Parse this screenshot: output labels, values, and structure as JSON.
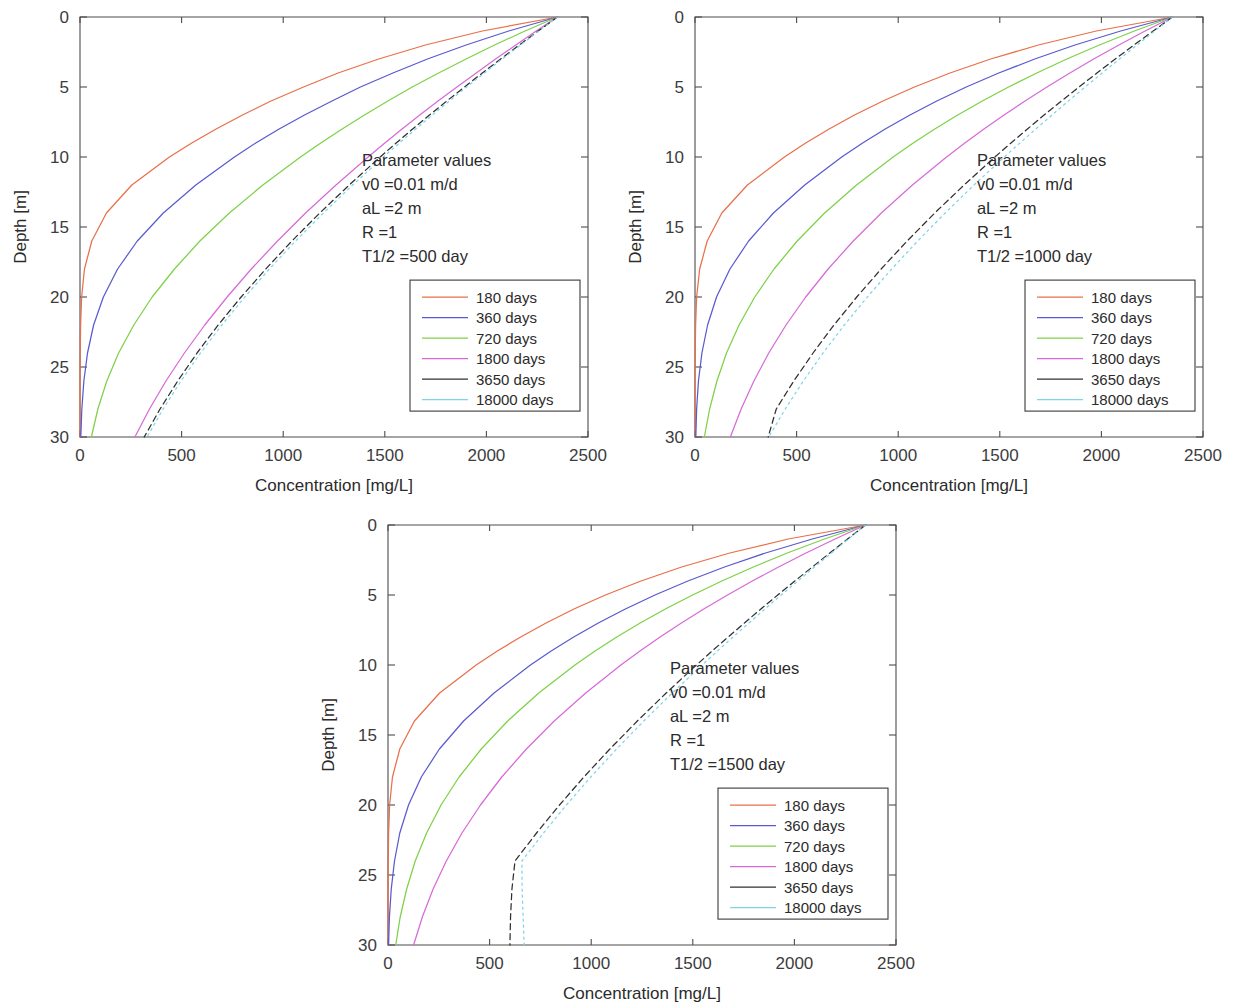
{
  "figure": {
    "panel_count": 3,
    "common": {
      "xlabel": "Concentration [mg/L]",
      "ylabel": "Depth [m]",
      "xticks": [
        "0",
        "500",
        "1000",
        "1500",
        "2000",
        "2500"
      ],
      "yticks": [
        "0",
        "5",
        "10",
        "15",
        "20",
        "25",
        "30"
      ],
      "param_header": "Parameter values",
      "param_v0": "v0 =0.01 m/d",
      "param_aL": "aL =2 m",
      "param_R": "R =1"
    },
    "colors": {
      "c180": "#e8704a",
      "c360": "#5a5ad0",
      "c720": "#7ed148",
      "c1800": "#d86ad8",
      "c3650": "#303030",
      "c18000": "#7fd4e8",
      "axis": "#4d4d4d",
      "text": "#2b2b2b"
    },
    "legend": {
      "entries": [
        {
          "label": "180 days",
          "color_key": "c180"
        },
        {
          "label": "360 days",
          "color_key": "c360"
        },
        {
          "label": "720 days",
          "color_key": "c720"
        },
        {
          "label": "1800 days",
          "color_key": "c1800"
        },
        {
          "label": "3650 days",
          "color_key": "c3650"
        },
        {
          "label": "18000 days",
          "color_key": "c18000"
        }
      ]
    }
  },
  "chart_data": [
    {
      "type": "line",
      "panel_id": "panel-1",
      "title": "",
      "xlabel": "Concentration [mg/L]",
      "ylabel": "Depth [m]",
      "xlim": [
        0,
        2500
      ],
      "ylim": [
        30,
        0
      ],
      "y_inverted": true,
      "grid": false,
      "legend_position": "inside-right-lower",
      "annotation": {
        "header": "Parameter values",
        "lines": [
          "v0 =0.01 m/d",
          "aL =2 m",
          "R =1",
          "T1/2 =500 day"
        ],
        "half_life_days": 500
      },
      "x_tick_values": [
        0,
        500,
        1000,
        1500,
        2000,
        2500
      ],
      "y_tick_values": [
        0,
        5,
        10,
        15,
        20,
        25,
        30
      ],
      "source_concentration": 2350,
      "depths": [
        0,
        1,
        2,
        3,
        4,
        5,
        6,
        7,
        8,
        9,
        10,
        12,
        14,
        16,
        18,
        20,
        22,
        24,
        26,
        28,
        30
      ],
      "series": [
        {
          "name": "180 days",
          "color": "#e8704a",
          "values": [
            2350,
            1980,
            1700,
            1470,
            1270,
            1100,
            940,
            800,
            670,
            550,
            440,
            255,
            130,
            58,
            22,
            8,
            3,
            1,
            0,
            0,
            0
          ]
        },
        {
          "name": "360 days",
          "color": "#5a5ad0",
          "values": [
            2350,
            2110,
            1900,
            1710,
            1540,
            1380,
            1240,
            1105,
            980,
            865,
            760,
            570,
            410,
            282,
            185,
            115,
            67,
            37,
            19,
            9,
            4
          ]
        },
        {
          "name": "720 days",
          "color": "#7ed148",
          "values": [
            2350,
            2190,
            2040,
            1900,
            1765,
            1635,
            1515,
            1400,
            1290,
            1185,
            1085,
            900,
            735,
            590,
            465,
            355,
            265,
            190,
            132,
            88,
            56
          ]
        },
        {
          "name": "1800 days",
          "color": "#d86ad8",
          "values": [
            2350,
            2245,
            2145,
            2045,
            1950,
            1855,
            1762,
            1672,
            1585,
            1500,
            1418,
            1260,
            1110,
            972,
            843,
            724,
            614,
            514,
            423,
            342,
            270
          ]
        },
        {
          "name": "3650 days",
          "color": "#303030",
          "values": [
            2350,
            2255,
            2162,
            2070,
            1980,
            1892,
            1805,
            1720,
            1637,
            1556,
            1477,
            1325,
            1180,
            1043,
            914,
            793,
            680,
            576,
            481,
            394,
            316
          ]
        },
        {
          "name": "18000 days",
          "color": "#7fd4e8",
          "values": [
            2350,
            2258,
            2168,
            2078,
            1990,
            1903,
            1818,
            1734,
            1652,
            1572,
            1493,
            1342,
            1198,
            1061,
            932,
            811,
            698,
            593,
            497,
            409,
            330
          ]
        }
      ]
    },
    {
      "type": "line",
      "panel_id": "panel-2",
      "title": "",
      "xlabel": "Concentration [mg/L]",
      "ylabel": "Depth [m]",
      "xlim": [
        0,
        2500
      ],
      "ylim": [
        30,
        0
      ],
      "y_inverted": true,
      "grid": false,
      "legend_position": "inside-right-lower",
      "annotation": {
        "header": "Parameter values",
        "lines": [
          "v0 =0.01 m/d",
          "aL =2 m",
          "R =1",
          "T1/2 =1000 day"
        ],
        "half_life_days": 1000
      },
      "x_tick_values": [
        0,
        500,
        1000,
        1500,
        2000,
        2500
      ],
      "y_tick_values": [
        0,
        5,
        10,
        15,
        20,
        25,
        30
      ],
      "source_concentration": 2350,
      "depths": [
        0,
        1,
        2,
        3,
        4,
        5,
        6,
        7,
        8,
        9,
        10,
        12,
        14,
        16,
        18,
        20,
        22,
        24,
        26,
        28,
        30
      ],
      "series": [
        {
          "name": "180 days",
          "color": "#e8704a",
          "values": [
            2350,
            1975,
            1690,
            1455,
            1255,
            1080,
            925,
            785,
            660,
            545,
            440,
            258,
            132,
            60,
            23,
            8,
            3,
            1,
            0,
            0,
            0
          ]
        },
        {
          "name": "360 days",
          "color": "#5a5ad0",
          "values": [
            2350,
            2095,
            1870,
            1672,
            1495,
            1335,
            1190,
            1058,
            936,
            825,
            722,
            540,
            386,
            264,
            172,
            106,
            62,
            34,
            17,
            8,
            4
          ]
        },
        {
          "name": "720 days",
          "color": "#7ed148",
          "values": [
            2350,
            2162,
            1990,
            1830,
            1682,
            1543,
            1414,
            1293,
            1180,
            1074,
            975,
            795,
            638,
            503,
            389,
            294,
            217,
            155,
            108,
            72,
            46
          ]
        },
        {
          "name": "1800 days",
          "color": "#d86ad8",
          "values": [
            2350,
            2215,
            2086,
            1962,
            1845,
            1732,
            1624,
            1521,
            1422,
            1328,
            1238,
            1070,
            917,
            779,
            655,
            545,
            448,
            363,
            290,
            227,
            174
          ]
        },
        {
          "name": "3650 days",
          "color": "#303030",
          "values": [
            2350,
            2255,
            2160,
            2068,
            1978,
            1890,
            1803,
            1718,
            1636,
            1555,
            1476,
            1324,
            1180,
            1044,
            916,
            796,
            684,
            581,
            486,
            400,
            360
          ]
        },
        {
          "name": "18000 days",
          "color": "#7fd4e8",
          "values": [
            2350,
            2262,
            2175,
            2089,
            2004,
            1920,
            1838,
            1757,
            1677,
            1599,
            1522,
            1373,
            1231,
            1096,
            968,
            848,
            735,
            630,
            533,
            444,
            363
          ]
        }
      ]
    },
    {
      "type": "line",
      "panel_id": "panel-3",
      "title": "",
      "xlabel": "Concentration [mg/L]",
      "ylabel": "Depth [m]",
      "xlim": [
        0,
        2500
      ],
      "ylim": [
        30,
        0
      ],
      "y_inverted": true,
      "grid": false,
      "legend_position": "inside-right-lower",
      "annotation": {
        "header": "Parameter values",
        "lines": [
          "v0 =0.01 m/d",
          "aL =2 m",
          "R =1",
          "T1/2 =1500 day"
        ],
        "half_life_days": 1500
      },
      "x_tick_values": [
        0,
        500,
        1000,
        1500,
        2000,
        2500
      ],
      "y_tick_values": [
        0,
        5,
        10,
        15,
        20,
        25,
        30
      ],
      "source_concentration": 2350,
      "depths": [
        0,
        1,
        2,
        3,
        4,
        5,
        6,
        7,
        8,
        9,
        10,
        12,
        14,
        16,
        18,
        20,
        22,
        24,
        26,
        28,
        30
      ],
      "series": [
        {
          "name": "180 days",
          "color": "#e8704a",
          "values": [
            2350,
            1970,
            1682,
            1445,
            1245,
            1070,
            915,
            778,
            653,
            538,
            434,
            254,
            130,
            58,
            22,
            8,
            3,
            1,
            0,
            0,
            0
          ]
        },
        {
          "name": "360 days",
          "color": "#5a5ad0",
          "values": [
            2350,
            2088,
            1858,
            1656,
            1476,
            1314,
            1168,
            1035,
            914,
            803,
            701,
            522,
            372,
            253,
            164,
            101,
            58,
            32,
            16,
            7,
            3
          ]
        },
        {
          "name": "720 days",
          "color": "#7ed148",
          "values": [
            2350,
            2148,
            1965,
            1798,
            1643,
            1499,
            1365,
            1241,
            1126,
            1019,
            920,
            742,
            589,
            459,
            350,
            261,
            190,
            134,
            92,
            60,
            38
          ]
        },
        {
          "name": "1800 days",
          "color": "#d86ad8",
          "values": [
            2350,
            2200,
            2057,
            1922,
            1793,
            1671,
            1554,
            1444,
            1339,
            1240,
            1146,
            973,
            818,
            681,
            560,
            455,
            364,
            287,
            222,
            169,
            126
          ]
        },
        {
          "name": "3650 days",
          "color": "#303030",
          "values": [
            2350,
            2262,
            2174,
            2088,
            2002,
            1918,
            1835,
            1754,
            1674,
            1595,
            1518,
            1369,
            1227,
            1092,
            964,
            844,
            731,
            625,
            610,
            603,
            600
          ]
        },
        {
          "name": "18000 days",
          "color": "#7fd4e8",
          "values": [
            2350,
            2266,
            2182,
            2099,
            2017,
            1935,
            1855,
            1776,
            1698,
            1621,
            1546,
            1399,
            1259,
            1125,
            998,
            878,
            765,
            659,
            660,
            665,
            670
          ]
        }
      ]
    }
  ]
}
